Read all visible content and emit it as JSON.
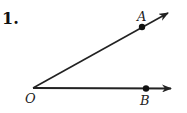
{
  "problem": {
    "number": "1."
  },
  "diagram": {
    "vertex": {
      "label": "O"
    },
    "points": [
      {
        "label": "A"
      },
      {
        "label": "B"
      }
    ],
    "rays": [
      "OA",
      "OB"
    ]
  }
}
